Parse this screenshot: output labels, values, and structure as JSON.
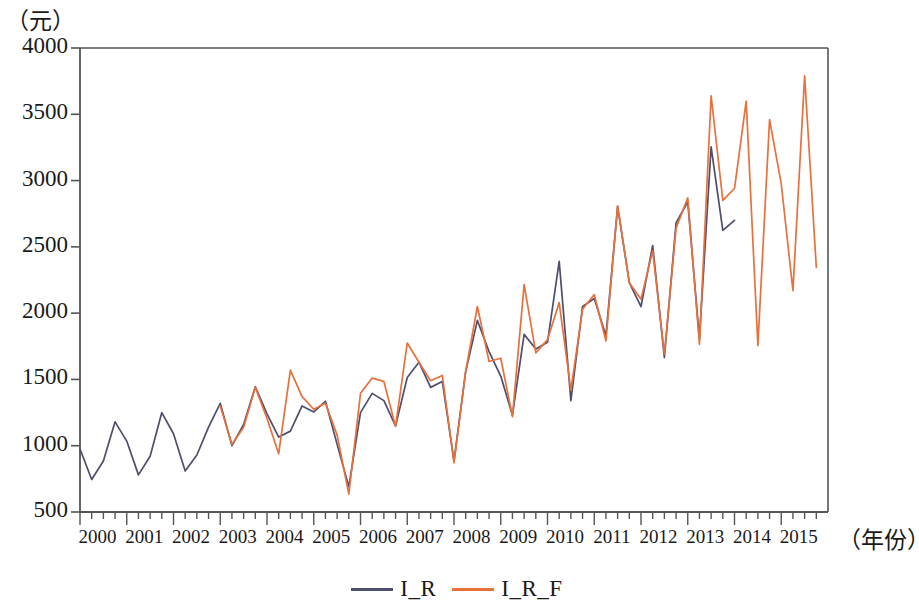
{
  "chart_data": {
    "type": "line",
    "title": "",
    "xlabel": "（年份）",
    "ylabel": "（元）",
    "ylim": [
      500,
      4000
    ],
    "yticks": [
      500,
      1000,
      1500,
      2000,
      2500,
      3000,
      3500,
      4000
    ],
    "ytick_labels": [
      "500",
      "1000",
      "1500",
      "2000",
      "2500",
      "3000",
      "3500",
      "4000"
    ],
    "xticks": [
      2000,
      2001,
      2002,
      2003,
      2004,
      2005,
      2006,
      2007,
      2008,
      2009,
      2010,
      2011,
      2012,
      2013,
      2014,
      2015
    ],
    "xtick_labels": [
      "2000",
      "2001",
      "2002",
      "2003",
      "2004",
      "2005",
      "2006",
      "2007",
      "2008",
      "2009",
      "2010",
      "2011",
      "2012",
      "2013",
      "2014",
      "2015"
    ],
    "x_minor_ticks_per_year": 4,
    "frequency": "quarterly",
    "x_start": 2000.0,
    "x_end": 2015.75,
    "grid": false,
    "legend_position": "bottom-center",
    "colors": {
      "I_R": "#4e4e6e",
      "I_R_F": "#e8703c",
      "axis": "#555555",
      "text": "#1a1a1a"
    },
    "series": [
      {
        "name": "I_R",
        "color": "#4e4e6e",
        "x": [
          2000.0,
          2000.25,
          2000.5,
          2000.75,
          2001.0,
          2001.25,
          2001.5,
          2001.75,
          2002.0,
          2002.25,
          2002.5,
          2002.75,
          2003.0,
          2003.25,
          2003.5,
          2003.75,
          2004.0,
          2004.25,
          2004.5,
          2004.75,
          2005.0,
          2005.25,
          2005.5,
          2005.75,
          2006.0,
          2006.25,
          2006.5,
          2006.75,
          2007.0,
          2007.25,
          2007.5,
          2007.75,
          2008.0,
          2008.25,
          2008.5,
          2008.75,
          2009.0,
          2009.25,
          2009.5,
          2009.75,
          2010.0,
          2010.25,
          2010.5,
          2010.75,
          2011.0,
          2011.25,
          2011.5,
          2011.75,
          2012.0,
          2012.25,
          2012.5,
          2012.75,
          2013.0,
          2013.25,
          2013.5,
          2013.75,
          2014.0
        ],
        "values": [
          975,
          745,
          885,
          1180,
          1035,
          780,
          920,
          1250,
          1090,
          810,
          930,
          1140,
          1320,
          1000,
          1160,
          1445,
          1240,
          1065,
          1110,
          1300,
          1255,
          1335,
          1010,
          690,
          1250,
          1395,
          1340,
          1150,
          1515,
          1630,
          1440,
          1485,
          885,
          1560,
          1945,
          1710,
          1525,
          1230,
          1840,
          1730,
          1780,
          2390,
          1340,
          2050,
          2110,
          1830,
          2805,
          2230,
          2050,
          2510,
          1665,
          2680,
          2840,
          1805,
          3255,
          2625,
          2700
        ]
      },
      {
        "name": "I_R_F",
        "color": "#e8703c",
        "x": [
          2003.0,
          2003.25,
          2003.5,
          2003.75,
          2004.0,
          2004.25,
          2004.5,
          2004.75,
          2005.0,
          2005.25,
          2005.5,
          2005.75,
          2006.0,
          2006.25,
          2006.5,
          2006.75,
          2007.0,
          2007.25,
          2007.5,
          2007.75,
          2008.0,
          2008.25,
          2008.5,
          2008.75,
          2009.0,
          2009.25,
          2009.5,
          2009.75,
          2010.0,
          2010.25,
          2010.5,
          2010.75,
          2011.0,
          2011.25,
          2011.5,
          2011.75,
          2012.0,
          2012.25,
          2012.5,
          2012.75,
          2013.0,
          2013.25,
          2013.5,
          2013.75,
          2014.0,
          2014.25,
          2014.5,
          2014.75,
          2015.0,
          2015.25,
          2015.5,
          2015.75
        ],
        "values": [
          1300,
          1010,
          1140,
          1440,
          1205,
          940,
          1570,
          1370,
          1275,
          1320,
          1080,
          635,
          1395,
          1510,
          1485,
          1145,
          1775,
          1630,
          1490,
          1530,
          870,
          1560,
          2050,
          1635,
          1660,
          1220,
          2215,
          1700,
          1800,
          2080,
          1420,
          2030,
          2140,
          1790,
          2810,
          2230,
          2105,
          2470,
          1690,
          2640,
          2870,
          1765,
          3640,
          2850,
          2940,
          3600,
          1755,
          3460,
          2975,
          2170,
          3790,
          2345
        ]
      }
    ]
  },
  "axis": {
    "y_unit": "（元）",
    "x_unit": "（年份）"
  },
  "legend": {
    "items": [
      {
        "label": "I_R",
        "color": "#4e4e6e"
      },
      {
        "label": "I_R_F",
        "color": "#e8703c"
      }
    ]
  }
}
